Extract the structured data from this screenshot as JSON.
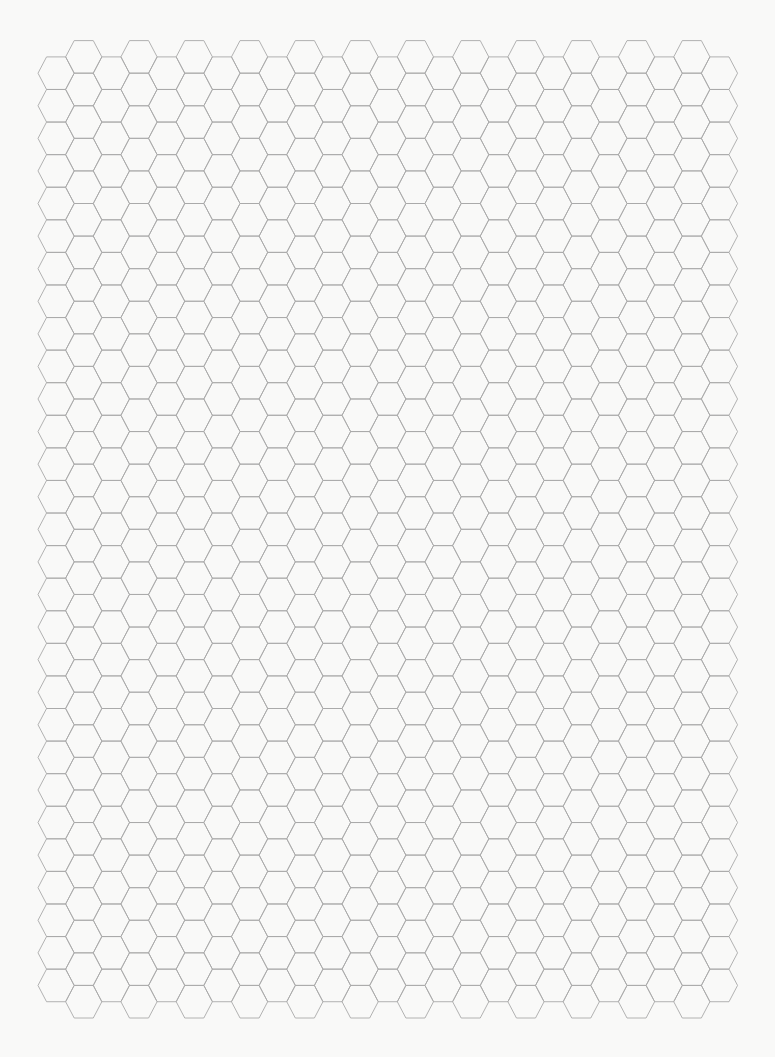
{
  "page": {
    "width": 775,
    "height": 1057,
    "background_color": "#f9f9f8"
  },
  "hex_grid": {
    "orientation": "flat-top",
    "columns": 25,
    "column_step": 27.64,
    "hex_width": 36.2,
    "hex_height": 32.58,
    "origin_x": 38,
    "raised_column_top_y": 40.6,
    "lower_column_top_y": 56.9,
    "raised_columns_parity": "odd",
    "rows_in_raised_columns": 30,
    "rows_in_lower_columns": 29,
    "line_color": "#a9a9a9",
    "line_width": 0.9
  }
}
